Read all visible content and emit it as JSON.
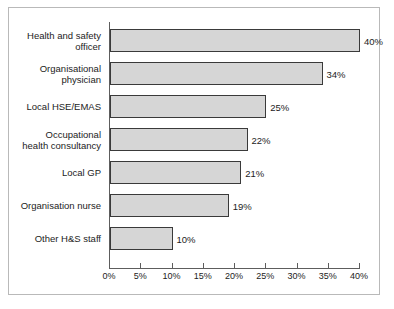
{
  "chart_data": {
    "type": "bar",
    "orientation": "horizontal",
    "title": "",
    "xlabel": "",
    "ylabel": "",
    "xlim": [
      0,
      40
    ],
    "grid": false,
    "legend": null,
    "tick_labels": [
      "0%",
      "5%",
      "10%",
      "15%",
      "20%",
      "25%",
      "30%",
      "35%",
      "40%"
    ],
    "tick_values": [
      0,
      5,
      10,
      15,
      20,
      25,
      30,
      35,
      40
    ],
    "categories": [
      "Health and safety\nofficer",
      "Organisational\nphysician",
      "Local HSE/EMAS",
      "Occupational\nhealth consultancy",
      "Local GP",
      "Organisation nurse",
      "Other H&S staff"
    ],
    "values": [
      40,
      34,
      25,
      22,
      21,
      19,
      10
    ],
    "data_labels": [
      "40%",
      "34%",
      "25%",
      "22%",
      "21%",
      "19%",
      "10%"
    ],
    "colors": {
      "bar_fill": "#d6d6d6",
      "bar_stroke": "#3a3a3a",
      "axis": "#5d5d5d",
      "text": "#1c1c1c",
      "frame": "#b9b9b9",
      "background": "#ffffff"
    }
  }
}
